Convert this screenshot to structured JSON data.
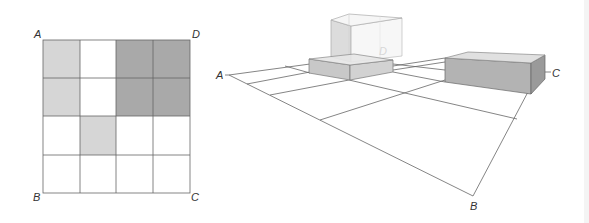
{
  "figure": {
    "left_grid": {
      "rows": 4,
      "cols": 4,
      "corner_labels": {
        "top_left": "A",
        "top_right": "D",
        "bottom_left": "B",
        "bottom_right": "C"
      },
      "shading": [
        [
          "light",
          "none",
          "dark",
          "dark"
        ],
        [
          "light",
          "none",
          "dark",
          "dark"
        ],
        [
          "none",
          "light",
          "none",
          "none"
        ],
        [
          "none",
          "none",
          "none",
          "none"
        ]
      ]
    },
    "perspective_view": {
      "corner_labels": {
        "left": "A",
        "bottom": "B",
        "right": "C",
        "back": "D"
      }
    },
    "colors": {
      "light_cell": "#d6d6d6",
      "dark_cell": "#a9a9a9",
      "line": "#555555",
      "label": "#333333"
    }
  }
}
